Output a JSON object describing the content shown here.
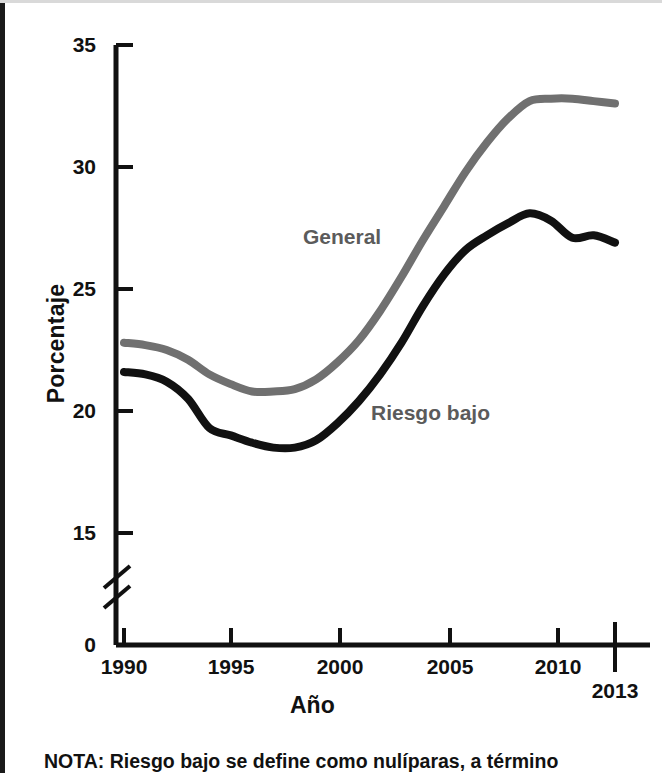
{
  "figure": {
    "background_color": "#ffffff",
    "note_text": "NOTA: Riesgo bajo se define como nulíparas, a término"
  },
  "axes": {
    "y_axis_title": "Porcentaje",
    "x_axis_title": "Año",
    "y_tick_labels": [
      "35",
      "30",
      "25",
      "20",
      "15",
      "0"
    ],
    "x_tick_labels": [
      "1990",
      "1995",
      "2000",
      "2005",
      "2010",
      "2013"
    ],
    "axis_break": "double-slash-break"
  },
  "series_labels": {
    "general": "General",
    "low_risk": "Riesgo bajo"
  },
  "colors": {
    "general_line": "#707070",
    "low_risk_line": "#111111",
    "axis": "#111111",
    "text": "#111111",
    "series_label_text": "#5b5b5b"
  },
  "chart_data": {
    "type": "line",
    "title": "",
    "xlabel": "Año",
    "ylabel": "Porcentaje",
    "xlim": [
      1990,
      2013
    ],
    "ylim": [
      15,
      35
    ],
    "y_ticks": [
      15,
      20,
      25,
      30,
      35
    ],
    "x_ticks": [
      1990,
      1995,
      2000,
      2005,
      2010,
      2013
    ],
    "grid": false,
    "legend": "inline-annotations",
    "axis_break_below": 15,
    "series": [
      {
        "name": "General",
        "color": "#707070",
        "x": [
          1990,
          1991,
          1992,
          1993,
          1994,
          1995,
          1996,
          1997,
          1998,
          1999,
          2000,
          2001,
          2002,
          2003,
          2004,
          2005,
          2006,
          2007,
          2008,
          2009,
          2010,
          2011,
          2012,
          2013
        ],
        "values": [
          22.8,
          22.7,
          22.5,
          22.1,
          21.5,
          21.1,
          20.8,
          20.8,
          20.9,
          21.3,
          22.0,
          22.9,
          24.1,
          25.5,
          27.0,
          28.4,
          29.8,
          31.0,
          32.0,
          32.7,
          32.8,
          32.8,
          32.7,
          32.6
        ]
      },
      {
        "name": "Riesgo bajo",
        "color": "#111111",
        "x": [
          1990,
          1991,
          1992,
          1993,
          1994,
          1995,
          1996,
          1997,
          1998,
          1999,
          2000,
          2001,
          2002,
          2003,
          2004,
          2005,
          2006,
          2007,
          2008,
          2009,
          2010,
          2011,
          2012,
          2013
        ],
        "values": [
          21.6,
          21.5,
          21.2,
          20.5,
          19.3,
          19.0,
          18.7,
          18.5,
          18.5,
          18.8,
          19.5,
          20.4,
          21.5,
          22.8,
          24.3,
          25.6,
          26.6,
          27.2,
          27.7,
          28.1,
          27.8,
          27.1,
          27.2,
          26.9
        ]
      }
    ]
  }
}
